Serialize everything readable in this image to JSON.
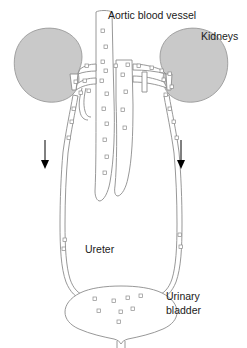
{
  "figure": {
    "background_color": "#ffffff"
  },
  "colors": {
    "kidney_fill": "#c9c9c9",
    "kidney_stroke": "#9a9a9a",
    "vessel_fill": "#ffffff",
    "vessel_stroke": "#8c8c8c",
    "bladder_fill": "#ffffff",
    "bladder_stroke": "#8c8c8c",
    "label_text": "#1a1a1a",
    "arrow_color": "#000000",
    "speckle_stroke": "#8c8c8c"
  },
  "labels": {
    "aorta": "Aortic blood vessel",
    "kidneys": "Kidneys",
    "ureter": "Ureter",
    "bladder_line1": "Urinary",
    "bladder_line2": "bladder"
  },
  "structures": {
    "kidney_left": "kidney-left",
    "kidney_right": "kidney-right",
    "aorta": "aortic-blood-vessel",
    "renal_vessels": "renal-vessels",
    "ureter_left": "ureter-left",
    "ureter_right": "ureter-right",
    "bladder": "urinary-bladder",
    "urethra": "urethra"
  },
  "flow_arrows": [
    {
      "name": "flow-arrow-left",
      "direction": "down",
      "x": 45,
      "y_top": 140,
      "y_bottom": 168
    },
    {
      "name": "flow-arrow-right",
      "direction": "down",
      "x": 181,
      "y_top": 140,
      "y_bottom": 168
    }
  ]
}
